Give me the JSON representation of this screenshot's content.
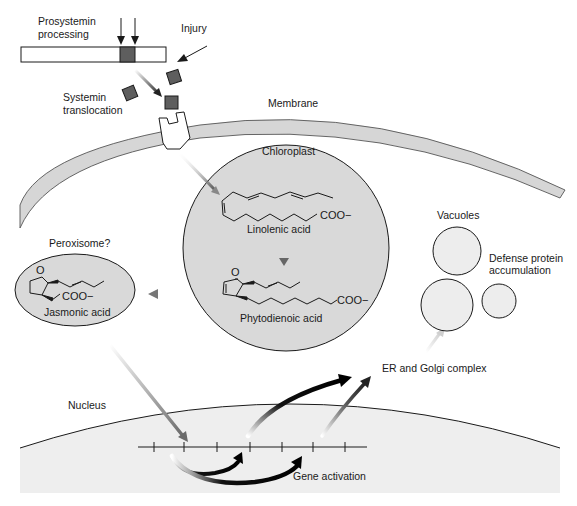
{
  "diagram": {
    "type": "signaling-pathway",
    "colors": {
      "background": "#ffffff",
      "organelle_fill": "#d9d9d9",
      "nucleus_fill": "#eeeeee",
      "membrane_fill": "#d6d6d6",
      "vacuole_fill": "#ededed",
      "systemin_fill": "#5e5e5e",
      "outline": "#1a1a1a"
    },
    "labels": {
      "prosystemin": "Prosystemin processing",
      "prosystemin_line1": "Prosystemin",
      "prosystemin_line2": "processing",
      "injury": "Injury",
      "systemin_line1": "Systemin",
      "systemin_line2": "translocation",
      "membrane": "Membrane",
      "chloroplast": "Chloroplast",
      "linolenic": "Linolenic acid",
      "phytodienoic": "Phytodienoic acid",
      "peroxisome": "Peroxisome?",
      "jasmonic": "Jasmonic acid",
      "vacuoles": "Vacuoles",
      "defense_line1": "Defense protein",
      "defense_line2": "accumulation",
      "er_golgi": "ER and Golgi complex",
      "nucleus": "Nucleus",
      "gene_activation": "Gene activation"
    },
    "chem_groups": {
      "carboxylate": "COO−",
      "ketone_o": "O"
    },
    "nodes": [
      {
        "id": "prosystemin",
        "label": "Prosystemin processing"
      },
      {
        "id": "systemin",
        "label": "Systemin translocation"
      },
      {
        "id": "receptor",
        "label": "Membrane receptor"
      },
      {
        "id": "chloroplast",
        "label": "Chloroplast"
      },
      {
        "id": "linolenic",
        "label": "Linolenic acid"
      },
      {
        "id": "phytodienoic",
        "label": "Phytodienoic acid"
      },
      {
        "id": "peroxisome",
        "label": "Peroxisome?"
      },
      {
        "id": "jasmonic",
        "label": "Jasmonic acid"
      },
      {
        "id": "nucleus",
        "label": "Nucleus"
      },
      {
        "id": "gene_activation",
        "label": "Gene activation"
      },
      {
        "id": "er_golgi",
        "label": "ER and Golgi complex"
      },
      {
        "id": "vacuoles",
        "label": "Vacuoles"
      }
    ],
    "edges": [
      {
        "from": "injury",
        "to": "prosystemin"
      },
      {
        "from": "prosystemin",
        "to": "systemin"
      },
      {
        "from": "systemin",
        "to": "receptor"
      },
      {
        "from": "receptor",
        "to": "linolenic"
      },
      {
        "from": "linolenic",
        "to": "phytodienoic"
      },
      {
        "from": "phytodienoic",
        "to": "jasmonic"
      },
      {
        "from": "jasmonic",
        "to": "nucleus"
      },
      {
        "from": "nucleus",
        "to": "gene_activation"
      },
      {
        "from": "nucleus",
        "to": "er_golgi"
      },
      {
        "from": "er_golgi",
        "to": "vacuoles"
      }
    ]
  }
}
